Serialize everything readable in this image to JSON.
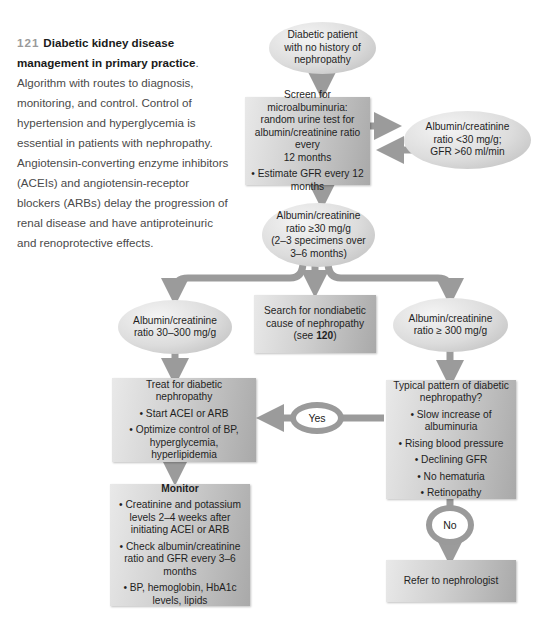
{
  "caption": {
    "figure_number": "121",
    "title": "Diabetic kidney disease management in primary practice",
    "body": ". Algorithm with routes to diagnosis, monitoring, and control. Control of hypertension and hyperglycemia is essential in patients with nephropathy. Angiotensin-converting enzyme inhibitors (ACEIs) and angiotensin-receptor blockers (ARBs) delay the progression of renal disease and have antiproteinuric and renoprotective effects."
  },
  "flowchart": {
    "start": {
      "lines": [
        "Diabetic patient",
        "with no history of",
        "nephropathy"
      ]
    },
    "screen": {
      "lines": [
        "Screen for microalbuminuria:",
        "random urine test for",
        "albumin/creatinine ratio every",
        "12 months"
      ],
      "bullet": "• Estimate GFR every 12 months"
    },
    "normal": {
      "lines": [
        "Albumin/creatinine",
        "ratio <30 mg/g;",
        "GFR >60 ml/min"
      ]
    },
    "elevated": {
      "lines": [
        "Albumin/creatinine",
        "ratio ≥30 mg/g",
        "(2–3 specimens over",
        "3–6 months)"
      ]
    },
    "micro": {
      "lines": [
        "Albumin/creatinine",
        "ratio 30–300 mg/g"
      ]
    },
    "nondiabetic": {
      "lines": [
        "Search for nondiabetic",
        "cause of nephropathy"
      ],
      "ref_prefix": "(see ",
      "ref": "120",
      "ref_suffix": ")"
    },
    "macro": {
      "lines": [
        "Albumin/creatinine",
        "ratio ≥ 300 mg/g"
      ]
    },
    "treat": {
      "title": "Treat for diabetic nephropathy",
      "bullets": [
        "• Start ACEI or ARB",
        "• Optimize control of BP, hyperglycemia, hyperlipidemia"
      ]
    },
    "typical": {
      "title": "Typical pattern of diabetic nephropathy?",
      "bullets": [
        "• Slow increase of albuminuria",
        "• Rising blood pressure",
        "• Declining GFR",
        "• No hematuria",
        "• Retinopathy"
      ]
    },
    "monitor": {
      "title": "Monitor",
      "bullets": [
        "• Creatinine and potassium levels 2–4 weeks after initiating ACEI or ARB",
        "• Check albumin/creatinine ratio and GFR every 3–6 months",
        "• BP, hemoglobin, HbA1c levels, lipids"
      ]
    },
    "yes_label": "Yes",
    "no_label": "No",
    "refer": {
      "label": "Refer to nephrologist"
    }
  },
  "colors": {
    "arrow": "#9b9b9b",
    "box_light": "#e9e9e9",
    "box_dark": "#a9a9a9",
    "fig_number": "#9a9a9a"
  }
}
